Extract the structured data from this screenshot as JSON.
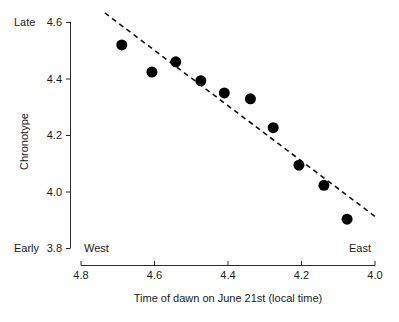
{
  "chart_data": {
    "type": "scatter",
    "title": "",
    "subtitle": "",
    "xlabel": "Time of dawn on June 21st (local time)",
    "ylabel": "Chronotype",
    "xlim": [
      4.8,
      4.0
    ],
    "ylim": [
      3.8,
      4.6
    ],
    "x_axis_reversed": true,
    "grid": false,
    "legend": null,
    "xticks": [
      "4.8",
      "4.6",
      "4.4",
      "4.2",
      "4.0"
    ],
    "xtick_values": [
      4.8,
      4.6,
      4.4,
      4.2,
      4.0
    ],
    "yticks": [
      "4.6",
      "4.4",
      "4.2",
      "4.0",
      "3.8"
    ],
    "ytick_values": [
      4.6,
      4.4,
      4.2,
      4.0,
      3.8
    ],
    "y_end_labels": {
      "high": "Late",
      "low": "Early"
    },
    "x_end_labels": {
      "left": "West",
      "right": "East"
    },
    "marker": {
      "shape": "circle",
      "color": "#000000",
      "size_px": 11
    },
    "trendline": {
      "style": "dashed",
      "color": "#111111",
      "x_start": 4.735,
      "y_start": 4.632,
      "x_end": 3.992,
      "y_end": 3.904
    },
    "points": [
      {
        "x": 4.689,
        "y": 4.519
      },
      {
        "x": 4.607,
        "y": 4.423
      },
      {
        "x": 4.542,
        "y": 4.459
      },
      {
        "x": 4.474,
        "y": 4.392
      },
      {
        "x": 4.41,
        "y": 4.349
      },
      {
        "x": 4.339,
        "y": 4.328
      },
      {
        "x": 4.277,
        "y": 4.226
      },
      {
        "x": 4.207,
        "y": 4.093
      },
      {
        "x": 4.139,
        "y": 4.022
      },
      {
        "x": 4.076,
        "y": 3.902
      }
    ]
  },
  "axes": {
    "y_axis_name": "chronotype-axis",
    "x_axis_name": "dawn-time-axis"
  }
}
